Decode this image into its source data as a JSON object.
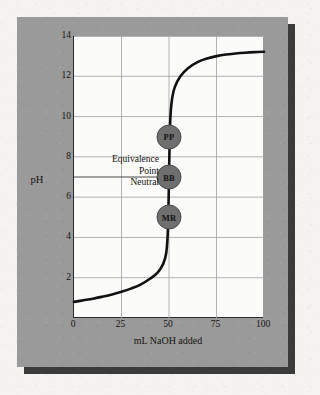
{
  "figure": {
    "panel_color": "#9a9a9a",
    "shadow_color": "#3b3b3b",
    "plot_background": "#fbfbfa",
    "page_background": "#f4f3ef"
  },
  "chart_data": {
    "type": "line",
    "title": "",
    "xlabel": "mL NaOH added",
    "ylabel": "pH",
    "xlim": [
      0,
      100
    ],
    "ylim": [
      0,
      14
    ],
    "xticks": [
      0,
      25,
      50,
      75,
      100
    ],
    "yticks": [
      2,
      4,
      6,
      8,
      10,
      12,
      14
    ],
    "grid": true,
    "grid_color": "#a9a9a9",
    "curve_color": "#111111",
    "series": [
      {
        "name": "Titration curve (strong acid titrated with NaOH)",
        "x": [
          0,
          5,
          10,
          15,
          20,
          25,
          30,
          35,
          40,
          44,
          47,
          48.5,
          49.3,
          49.7,
          50,
          50.3,
          50.7,
          51.5,
          53,
          56,
          60,
          65,
          70,
          75,
          80,
          85,
          90,
          95,
          100
        ],
        "y": [
          0.8,
          0.88,
          0.96,
          1.06,
          1.17,
          1.3,
          1.46,
          1.66,
          1.95,
          2.25,
          2.7,
          3.2,
          4.1,
          5.4,
          7.0,
          8.6,
          9.9,
          10.8,
          11.45,
          12.0,
          12.4,
          12.7,
          12.88,
          13.0,
          13.08,
          13.13,
          13.17,
          13.2,
          13.22
        ]
      }
    ],
    "reference_lines": [
      {
        "name": "neutral-equivalence-line",
        "orientation": "horizontal",
        "value": 7,
        "color": "#4a4a4a",
        "x_from": 0,
        "x_to": 50
      }
    ],
    "annotations": [
      {
        "name": "equivalence-point-label",
        "lines": [
          "Equivalence",
          "Point",
          "Neutral"
        ],
        "x": 25,
        "y": 7.5
      }
    ],
    "markers": [
      {
        "label": "PP",
        "name": "phenolphthalein",
        "x": 50,
        "y": 9.0
      },
      {
        "label": "BB",
        "name": "bromthymol-blue",
        "x": 50,
        "y": 7.0
      },
      {
        "label": "MR",
        "name": "methyl-red",
        "x": 50,
        "y": 5.0
      }
    ]
  }
}
